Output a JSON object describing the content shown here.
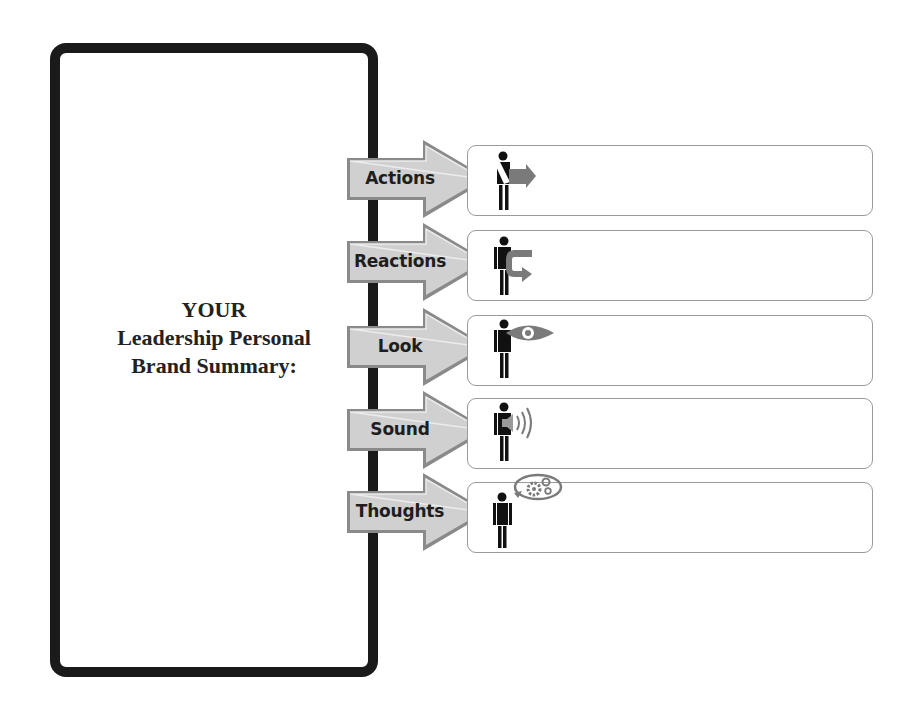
{
  "summary": {
    "title_lines": [
      "YOUR",
      "Leadership Personal",
      "Brand Summary:"
    ]
  },
  "rows": [
    {
      "label": "Actions",
      "icon": "person-arrow-right-icon",
      "value": ""
    },
    {
      "label": "Reactions",
      "icon": "person-u-turn-arrow-icon",
      "value": ""
    },
    {
      "label": "Look",
      "icon": "person-eye-icon",
      "value": ""
    },
    {
      "label": "Sound",
      "icon": "person-speaker-icon",
      "value": ""
    },
    {
      "label": "Thoughts",
      "icon": "person-thought-gears-icon",
      "value": ""
    }
  ],
  "colors": {
    "frame": "#1a1a1a",
    "arrow_fill": "#cfcfcf",
    "arrow_edge": "#8a8a8a",
    "icon_dark": "#111111",
    "icon_gray": "#7a7a7a",
    "box_border": "#9a9a9a"
  }
}
